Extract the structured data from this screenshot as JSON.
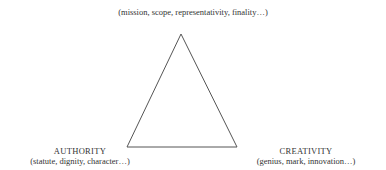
{
  "diagram": {
    "type": "triangle",
    "vertices": {
      "top": {
        "title": "",
        "subtitle": "(mission, scope, representativity, finality…)"
      },
      "left": {
        "title": "AUTHORITY",
        "subtitle": "(statute, dignity, character…)"
      },
      "right": {
        "title": "CREATIVITY",
        "subtitle": "(genius, mark, innovation…)"
      }
    },
    "stroke_color": "#555555"
  }
}
